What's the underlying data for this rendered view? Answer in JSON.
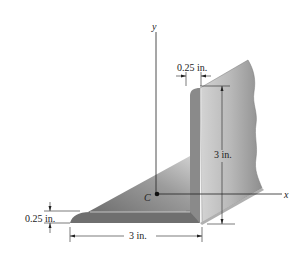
{
  "diagram": {
    "type": "angle-cross-section",
    "axes": {
      "y_label": "y",
      "x_label": "x",
      "centroid_label": "C"
    },
    "dimensions": {
      "top_thickness": "0.25 in.",
      "vertical_leg": "3 in.",
      "bottom_thickness": "0.25 in.",
      "horizontal_leg": "3 in."
    },
    "colors": {
      "dark_face": "#7a7a7a",
      "mid_face": "#9a9a9a",
      "light_face": "#c8c8c8",
      "line": "#222222"
    }
  }
}
